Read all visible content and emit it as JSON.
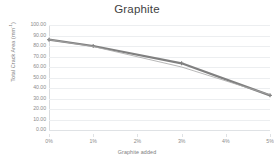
{
  "chart_data": {
    "type": "line",
    "title": "Graphite",
    "xlabel": "Graphite added",
    "ylabel": "Total Crack Area (mm",
    "ylabel_sup": "-1",
    "ylabel_suffix": ")",
    "x": [
      0,
      1,
      2,
      3,
      4,
      5
    ],
    "xtick_labels": [
      "0%",
      "1%",
      "2%",
      "3%",
      "4%",
      "5%"
    ],
    "ytick_labels": [
      "100.00",
      "90.00",
      "80.00",
      "70.00",
      "60.00",
      "50.00",
      "40.00",
      "30.00",
      "20.00",
      "10.00",
      "0.00"
    ],
    "ytick_values": [
      100,
      90,
      80,
      70,
      60,
      50,
      40,
      30,
      20,
      10,
      0
    ],
    "xlim": [
      0,
      5
    ],
    "ylim": [
      0,
      100
    ],
    "grid": true,
    "legend": "none",
    "series": [
      {
        "name": "series-1",
        "style": "thick-marker",
        "color": "#808080",
        "width": 2.2,
        "marker": "cross",
        "x": [
          0,
          1,
          3,
          5
        ],
        "values": [
          86.0,
          80.0,
          63.5,
          33.0
        ]
      },
      {
        "name": "series-2",
        "style": "thin",
        "color": "#a6a6a6",
        "width": 0.8,
        "marker": "none",
        "x": [
          0,
          1,
          3,
          5
        ],
        "values": [
          86.0,
          79.5,
          60.0,
          33.5
        ]
      }
    ]
  }
}
